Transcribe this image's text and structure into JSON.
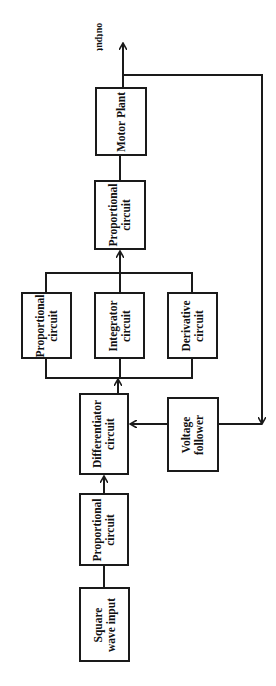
{
  "diagram": {
    "type": "block-diagram",
    "output_label": "output",
    "blocks": {
      "square_wave": {
        "line1": "Square",
        "line2": "wave input"
      },
      "proportional_lower": {
        "line1": "Proportional",
        "line2": "circuit"
      },
      "differentiator": {
        "line1": "Differentiator",
        "line2": "circuit"
      },
      "voltage_follower": {
        "line1": "Voltage",
        "line2": "follower"
      },
      "proportional_parallel": {
        "line1": "Proportional",
        "line2": "circuit"
      },
      "integrator": {
        "line1": "Integrator",
        "line2": "circuit"
      },
      "derivative": {
        "line1": "Derivative",
        "line2": "circuit"
      },
      "proportional_upper": {
        "line1": "Proportional",
        "line2": "circuit"
      },
      "motor_plant": {
        "line1": "Motor Plant"
      }
    },
    "colors": {
      "line": "#1a1a1a",
      "background": "#ffffff"
    }
  }
}
